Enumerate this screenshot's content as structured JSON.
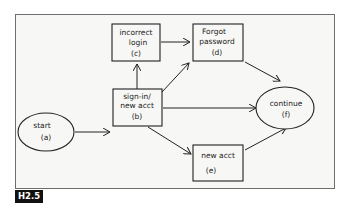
{
  "figure": {
    "label": "H2.5",
    "nodes": {
      "start": {
        "line1": "start",
        "line2": "(a)",
        "shape": "ellipse"
      },
      "signin": {
        "line1": "sign-in/",
        "line2": "new acct",
        "line3": "(b)",
        "shape": "box"
      },
      "incorrect": {
        "line1": "incorrect",
        "line2": "login",
        "line3": "(c)",
        "shape": "box"
      },
      "forgot": {
        "line1": "Forgot",
        "line2": "password",
        "line3": "(d)",
        "shape": "box"
      },
      "newacct": {
        "line1": "new acct",
        "line2": "(e)",
        "shape": "box"
      },
      "continue": {
        "line1": "continue",
        "line2": "(f)",
        "shape": "ellipse"
      }
    },
    "edges": [
      {
        "from": "a",
        "to": "b"
      },
      {
        "from": "b",
        "to": "c"
      },
      {
        "from": "b",
        "to": "d"
      },
      {
        "from": "b",
        "to": "f"
      },
      {
        "from": "b",
        "to": "e"
      },
      {
        "from": "c",
        "to": "d"
      },
      {
        "from": "d",
        "to": "f"
      },
      {
        "from": "e",
        "to": "f"
      }
    ],
    "colors": {
      "stroke": "#222222",
      "background": "#f7f7f5",
      "frame": "#6e6e6e",
      "label_bg": "#111111"
    }
  }
}
